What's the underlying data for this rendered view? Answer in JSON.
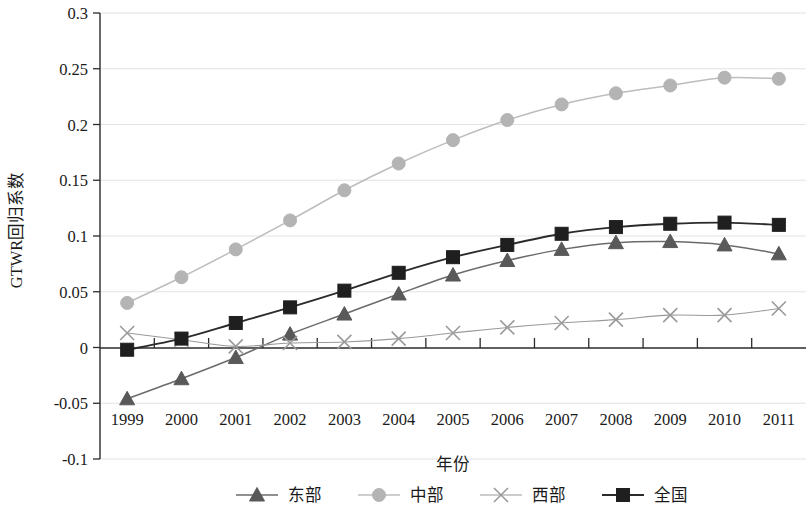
{
  "chart_data": {
    "type": "line",
    "title": "",
    "xlabel": "年份",
    "ylabel": "GTWR回归系数",
    "x": [
      1999,
      2000,
      2001,
      2002,
      2003,
      2004,
      2005,
      2006,
      2007,
      2008,
      2009,
      2010,
      2011
    ],
    "xtick_labels": [
      "1999",
      "2000",
      "2001",
      "2002",
      "2003",
      "2004",
      "2005",
      "2006",
      "2007",
      "2008",
      "2009",
      "2010",
      "2011"
    ],
    "ytick_labels": [
      "0.3",
      "0.25",
      "0.2",
      "0.15",
      "0.1",
      "0.05",
      "0",
      "-0.05",
      "-0.1"
    ],
    "ytick_values": [
      0.3,
      0.25,
      0.2,
      0.15,
      0.1,
      0.05,
      0,
      -0.05,
      -0.1
    ],
    "ylim": [
      -0.1,
      0.3
    ],
    "grid": true,
    "legend_position": "bottom",
    "series": [
      {
        "name": "东部",
        "marker": "triangle",
        "color": "#595959",
        "line_color": "#6b6b6b",
        "values": [
          -0.046,
          -0.028,
          -0.009,
          0.012,
          0.03,
          0.048,
          0.065,
          0.078,
          0.088,
          0.094,
          0.095,
          0.092,
          0.084
        ]
      },
      {
        "name": "中部",
        "marker": "circle",
        "color": "#b4b4b4",
        "line_color": "#bdbdbd",
        "values": [
          0.04,
          0.063,
          0.088,
          0.114,
          0.141,
          0.165,
          0.186,
          0.204,
          0.218,
          0.228,
          0.235,
          0.242,
          0.241
        ]
      },
      {
        "name": "西部",
        "marker": "x",
        "color": "#9a9a9a",
        "line_color": "#9a9a9a",
        "values": [
          0.013,
          0.007,
          0.001,
          0.004,
          0.005,
          0.008,
          0.013,
          0.018,
          0.022,
          0.025,
          0.029,
          0.029,
          0.035
        ]
      },
      {
        "name": "全国",
        "marker": "square",
        "color": "#1f1f1f",
        "line_color": "#2b2b2b",
        "values": [
          -0.002,
          0.008,
          0.022,
          0.036,
          0.051,
          0.067,
          0.081,
          0.092,
          0.102,
          0.108,
          0.111,
          0.112,
          0.11
        ]
      }
    ]
  },
  "legend": {
    "items": [
      {
        "label": "东部",
        "marker": "triangle"
      },
      {
        "label": "中部",
        "marker": "circle"
      },
      {
        "label": "西部",
        "marker": "x"
      },
      {
        "label": "全国",
        "marker": "square"
      }
    ]
  },
  "colors": {
    "dongbu": "#595959",
    "zhongbu": "#b4b4b4",
    "xibu": "#9a9a9a",
    "quanguo": "#1f1f1f",
    "grid": "#e2e2e2",
    "axis": "#2b2b2b",
    "background": "#ffffff"
  }
}
